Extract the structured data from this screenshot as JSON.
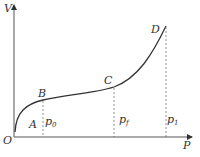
{
  "diagram": {
    "axes": {
      "y_label": "V",
      "x_label": "P",
      "origin_label": "O"
    },
    "points": [
      {
        "label": "A"
      },
      {
        "label": "B"
      },
      {
        "label": "C"
      },
      {
        "label": "D"
      }
    ],
    "pressure_marks": [
      {
        "base": "p",
        "sub": "0"
      },
      {
        "base": "p",
        "sub": "f"
      },
      {
        "base": "p",
        "sub": "1"
      }
    ],
    "colors": {
      "line": "#333333",
      "dashed": "#777777"
    }
  }
}
